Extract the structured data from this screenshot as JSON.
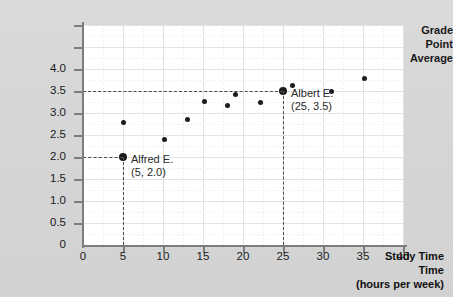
{
  "chart_data": {
    "type": "scatter",
    "title": "",
    "ylabel": "Grade Point Average",
    "xlabel": "Study Time",
    "xunits": "(hours per week)",
    "xlim": [
      0,
      40
    ],
    "ylim": [
      0,
      5.0
    ],
    "xticks": [
      "0",
      "5",
      "10",
      "15",
      "20",
      "25",
      "30",
      "35",
      "40"
    ],
    "xtick_values": [
      0,
      5,
      10,
      15,
      20,
      25,
      30,
      35,
      40
    ],
    "yticks": [
      "0.5",
      "1.0",
      "1.5",
      "2.0",
      "2.5",
      "3.0",
      "3.5",
      "4.0"
    ],
    "ytick_values": [
      0.5,
      1.0,
      1.5,
      2.0,
      2.5,
      3.0,
      3.5,
      4.0
    ],
    "y_origin_label": "0",
    "grid": "major-solid-minor-dotted",
    "legend": "none",
    "marker_color": "#1c1c1c",
    "points": [
      {
        "x": 5,
        "y": 2.0,
        "highlight": true,
        "label": "Alfred E."
      },
      {
        "x": 5,
        "y": 2.79,
        "highlight": false,
        "label": ""
      },
      {
        "x": 10.2,
        "y": 2.39,
        "highlight": false,
        "label": ""
      },
      {
        "x": 13.1,
        "y": 2.86,
        "highlight": false,
        "label": ""
      },
      {
        "x": 15.2,
        "y": 3.26,
        "highlight": false,
        "label": ""
      },
      {
        "x": 18.1,
        "y": 3.16,
        "highlight": false,
        "label": ""
      },
      {
        "x": 19.1,
        "y": 3.43,
        "highlight": false,
        "label": ""
      },
      {
        "x": 22.2,
        "y": 3.24,
        "highlight": false,
        "label": ""
      },
      {
        "x": 25,
        "y": 3.5,
        "highlight": true,
        "label": "Albert E."
      },
      {
        "x": 26.2,
        "y": 3.62,
        "highlight": false,
        "label": ""
      },
      {
        "x": 31.1,
        "y": 3.5,
        "highlight": false,
        "label": ""
      },
      {
        "x": 35.2,
        "y": 3.78,
        "highlight": false,
        "label": ""
      }
    ],
    "annotations": [
      {
        "name": "alfred",
        "title": "Alfred E.",
        "coords": "(5, 2.0)",
        "point": [
          5,
          2.0
        ]
      },
      {
        "name": "albert",
        "title": "Albert E.",
        "coords": "(25, 3.5)",
        "point": [
          25,
          3.5
        ]
      }
    ],
    "guides": [
      {
        "type": "horizontal",
        "value": 3.5,
        "from_x": 0,
        "to_x": 25
      },
      {
        "type": "vertical",
        "value": 25,
        "from_y": 0,
        "to_y": 3.5
      },
      {
        "type": "horizontal",
        "value": 2.0,
        "from_x": 0,
        "to_x": 5
      },
      {
        "type": "vertical",
        "value": 5,
        "from_y": 0,
        "to_y": 2.0
      }
    ]
  },
  "ylabel_lines": [
    "Grade",
    "Point",
    "Average"
  ]
}
